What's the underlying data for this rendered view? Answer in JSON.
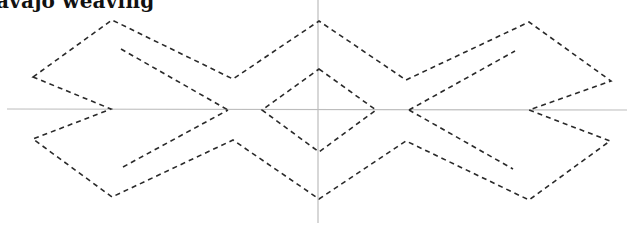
{
  "title_visible": "avajo weaving",
  "colors": {
    "axis": "#bdbdbd",
    "pattern": "#2a2a2a",
    "background": "#ffffff"
  },
  "axes": {
    "horizontal": {
      "x1": 7,
      "y1": 109,
      "x2": 627,
      "y2": 110
    },
    "vertical": {
      "x1": 318,
      "y1": 0,
      "x2": 318,
      "y2": 223
    }
  },
  "outer_shape_points": "33,77 112,20 233,79 319,21 406,80 529,22 611,81 529,110 610,141 529,200 406,141 319,199 233,140 112,197 33,139 111,109",
  "center_diamond_points": "319,69 376,110 319,152 262,110",
  "inner_lines": [
    {
      "name": "inner-line-upper-left",
      "points": "121,49 228,110"
    },
    {
      "name": "inner-line-lower-left",
      "points": "123,167 228,110"
    },
    {
      "name": "inner-line-upper-right",
      "points": "409,110 515,51"
    },
    {
      "name": "inner-line-lower-right",
      "points": "409,110 513,169"
    }
  ]
}
